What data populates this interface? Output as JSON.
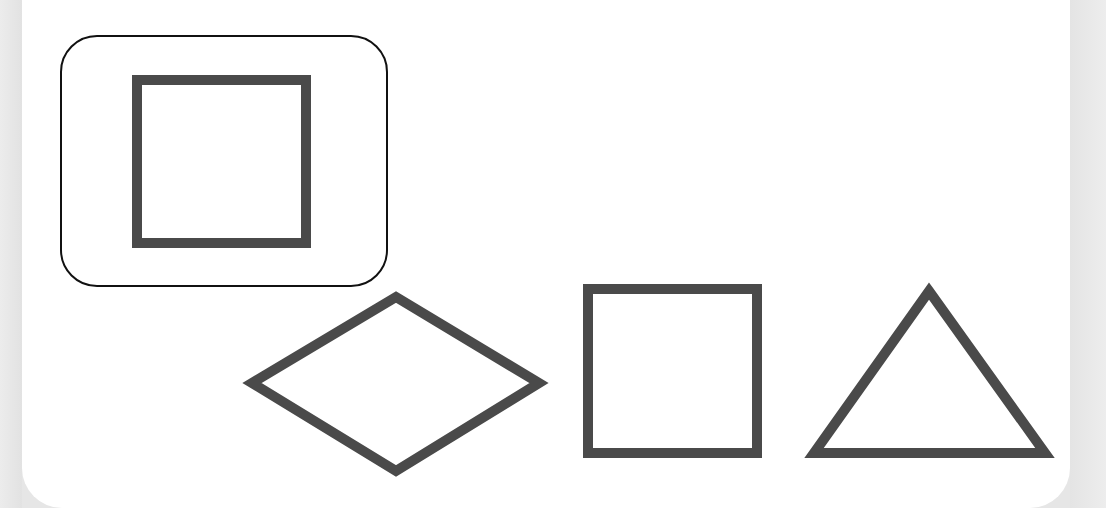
{
  "colors": {
    "background": "#e6e6e6",
    "card": "#ffffff",
    "shape_stroke": "#4a4a4a",
    "selection_frame": "#111111"
  },
  "prompt": {
    "target_shape": "square"
  },
  "target": {
    "shape": "square",
    "icon": "square-outline-icon",
    "selected": true
  },
  "options": [
    {
      "shape": "diamond",
      "icon": "diamond-outline-icon"
    },
    {
      "shape": "square",
      "icon": "square-outline-icon"
    },
    {
      "shape": "triangle",
      "icon": "triangle-outline-icon"
    }
  ]
}
